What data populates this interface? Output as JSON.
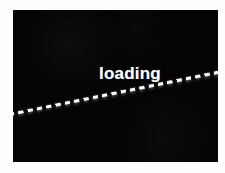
{
  "screen": {
    "name": "loading-screen",
    "background_color": "#040404",
    "frame_color": "#fdfdfd",
    "width": 205,
    "height": 152
  },
  "status": {
    "label": "loading",
    "text_color": "#ffffff"
  },
  "progress": {
    "indicator_name": "dashed-progress-line",
    "style": "dashed",
    "color": "#ffffff",
    "dash_length_px": 5,
    "dash_gap_px": 4,
    "thickness_px": 2,
    "angle_degrees": -11.4,
    "start_point": [
      14,
      119
    ],
    "end_point": [
      218,
      78
    ]
  }
}
